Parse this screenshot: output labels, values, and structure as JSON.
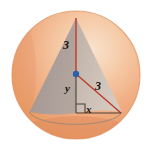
{
  "figure": {
    "background_color": "#ffffff",
    "canvas": {
      "width": 151,
      "height": 151
    },
    "sphere": {
      "name": "sphere",
      "center": {
        "x": 76,
        "y": 75
      },
      "radius": 64,
      "fill_color": "#F0AB80",
      "highlight_color": "#F7D8BD",
      "shadow_color": "#E08C5E",
      "outline_color": "#D98C5F"
    },
    "cone": {
      "name": "inscribed-cone",
      "apex": {
        "x": 76,
        "y": 18
      },
      "base_left": {
        "x": 30,
        "y": 113
      },
      "base_right": {
        "x": 122,
        "y": 113
      },
      "front_face_color": "#A89B96",
      "right_face_color": "#C8BBB1",
      "base_ellipse_color": "#9C908B"
    },
    "center_point": {
      "name": "sphere-center-point",
      "x": 76,
      "y": 74,
      "color": "#2B5FA8",
      "radius": 3.2
    },
    "segments": [
      {
        "name": "radius-to-apex",
        "from": {
          "x": 76,
          "y": 18
        },
        "to": {
          "x": 76,
          "y": 74
        },
        "color": "#C0392B",
        "label": "3"
      },
      {
        "name": "radius-to-base-rim",
        "from": {
          "x": 76,
          "y": 74
        },
        "to": {
          "x": 121,
          "y": 113
        },
        "color": "#C0392B",
        "label": "3"
      },
      {
        "name": "vertical-leg",
        "from": {
          "x": 76,
          "y": 74
        },
        "to": {
          "x": 76,
          "y": 113
        },
        "color": "#4A4038",
        "label": "y"
      },
      {
        "name": "horizontal-leg",
        "from": {
          "x": 76,
          "y": 113
        },
        "to": {
          "x": 121,
          "y": 113
        },
        "color": "#4A4038",
        "label": "x"
      }
    ],
    "right_angle_marker": {
      "name": "right-angle-marker",
      "corner": {
        "x": 76,
        "y": 113
      },
      "size": 9,
      "color": "#4A4038"
    },
    "labels": {
      "height_radius": "3",
      "slant_radius": "3",
      "vertical_leg": "y",
      "horizontal_leg": "x"
    }
  }
}
